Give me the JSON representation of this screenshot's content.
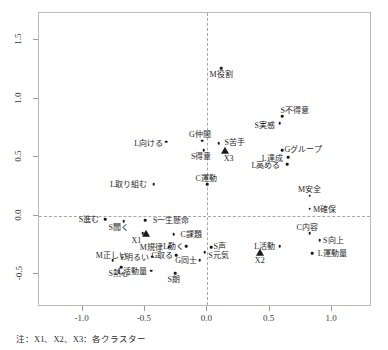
{
  "figure": {
    "footnote": "注：X1、X2、X3：各クラスター"
  },
  "chart_data": {
    "type": "scatter",
    "title": "",
    "xlabel": "",
    "ylabel": "",
    "xlim": [
      -1.35,
      1.32
    ],
    "ylim": [
      -0.78,
      1.73
    ],
    "grid": false,
    "legend": "none",
    "xticks": [
      "-1.0",
      "-0.5",
      "0.0",
      "0.5",
      "1.0"
    ],
    "xtick_values": [
      -1.0,
      -0.5,
      0.0,
      0.5,
      1.0
    ],
    "yticks": [
      "1.5",
      "1.0",
      "0.5",
      "0.0",
      "-0.5"
    ],
    "ytick_values": [
      1.5,
      1.0,
      0.5,
      0.0,
      -0.5
    ],
    "reference_lines": {
      "x": 0.0,
      "y": 0.0,
      "style": "dashed"
    },
    "annotations": [
      "X1、X2、X3 は各クラスターの重心（三角マーカー）"
    ],
    "points": [
      {
        "label": "M役割",
        "x": 0.11,
        "y": 1.26,
        "label_dx": 0,
        "label_dy": -0.055
      },
      {
        "label": "S不得意",
        "x": 0.6,
        "y": 0.85,
        "label_dx": 0.1,
        "label_dy": 0.05
      },
      {
        "label": "S実感",
        "x": 0.58,
        "y": 0.79,
        "label_dx": -0.12,
        "label_dy": -0.02
      },
      {
        "label": "G仲間",
        "x": -0.04,
        "y": 0.64,
        "label_dx": -0.02,
        "label_dy": 0.055
      },
      {
        "label": "S苦手",
        "x": 0.09,
        "y": 0.62,
        "label_dx": 0.13,
        "label_dy": 0.01
      },
      {
        "label": "S得意",
        "x": -0.03,
        "y": 0.56,
        "label_dx": -0.02,
        "label_dy": -0.055
      },
      {
        "label": "L向ける",
        "x": -0.33,
        "y": 0.63,
        "label_dx": -0.14,
        "label_dy": -0.01
      },
      {
        "label": "Gグループ",
        "x": 0.6,
        "y": 0.56,
        "label_dx": 0.17,
        "label_dy": 0.012
      },
      {
        "label": "L達成",
        "x": 0.65,
        "y": 0.5,
        "label_dx": -0.13,
        "label_dy": -0.005
      },
      {
        "label": "L高める",
        "x": 0.64,
        "y": 0.44,
        "label_dx": -0.17,
        "label_dy": -0.008
      },
      {
        "label": "C運動",
        "x": 0.0,
        "y": 0.27,
        "label_dx": -0.01,
        "label_dy": 0.055
      },
      {
        "label": "L取り組む",
        "x": -0.43,
        "y": 0.27,
        "label_dx": -0.2,
        "label_dy": 0.0
      },
      {
        "label": "M安全",
        "x": 0.82,
        "y": 0.17,
        "label_dx": 0.0,
        "label_dy": 0.055
      },
      {
        "label": "M確保",
        "x": 0.82,
        "y": 0.06,
        "label_dx": 0.12,
        "label_dy": 0.0
      },
      {
        "label": "S進む",
        "x": -0.82,
        "y": -0.03,
        "label_dx": -0.13,
        "label_dy": 0.0
      },
      {
        "label": "S聞く",
        "x": -0.67,
        "y": -0.05,
        "label_dx": -0.04,
        "label_dy": -0.05
      },
      {
        "label": "S一生懸命",
        "x": -0.5,
        "y": -0.04,
        "label_dx": 0.21,
        "label_dy": 0.0
      },
      {
        "label": "C内容",
        "x": 0.82,
        "y": -0.15,
        "label_dx": -0.02,
        "label_dy": 0.055
      },
      {
        "label": "S向上",
        "x": 0.9,
        "y": -0.21,
        "label_dx": 0.11,
        "label_dy": 0.0
      },
      {
        "label": "X1-point",
        "x": -0.52,
        "y": -0.15,
        "label_dx": 0.0,
        "label_dy": 0.0,
        "hidden_label": true
      },
      {
        "label": "C課題",
        "x": -0.27,
        "y": -0.16,
        "label_dx": 0.14,
        "label_dy": 0.0
      },
      {
        "label": "M規律",
        "x": -0.31,
        "y": -0.27,
        "label_dx": -0.14,
        "label_dy": 0.0
      },
      {
        "label": "L動く",
        "x": -0.17,
        "y": -0.26,
        "label_dx": -0.1,
        "label_dy": 0.0
      },
      {
        "label": "S声",
        "x": 0.03,
        "y": -0.27,
        "label_dx": 0.07,
        "label_dy": 0.015
      },
      {
        "label": "L活動",
        "x": 0.58,
        "y": -0.26,
        "label_dx": -0.12,
        "label_dy": 0.0
      },
      {
        "label": "S元気",
        "x": -0.02,
        "y": -0.31,
        "label_dx": 0.11,
        "label_dy": -0.025
      },
      {
        "label": "G取る",
        "x": -0.25,
        "y": -0.34,
        "label_dx": -0.11,
        "label_dy": 0.0
      },
      {
        "label": "E明るい",
        "x": -0.44,
        "y": -0.35,
        "label_dx": -0.14,
        "label_dy": 0.0
      },
      {
        "label": "G同士",
        "x": -0.06,
        "y": -0.38,
        "label_dx": -0.11,
        "label_dy": 0.0
      },
      {
        "label": "L運動量",
        "x": 0.84,
        "y": -0.32,
        "label_dx": 0.16,
        "label_dy": 0.0
      },
      {
        "label": "M正しい",
        "x": -0.76,
        "y": -0.38,
        "label_dx": -0.01,
        "label_dy": 0.048
      },
      {
        "label": "S熱心",
        "x": -0.69,
        "y": -0.44,
        "label_dx": -0.02,
        "label_dy": -0.05
      },
      {
        "label": "L活動量",
        "x": -0.45,
        "y": -0.47,
        "label_dx": -0.15,
        "label_dy": 0.0
      },
      {
        "label": "S朗",
        "x": -0.26,
        "y": -0.49,
        "label_dx": -0.01,
        "label_dy": -0.05
      }
    ],
    "centroids": [
      {
        "label": "X1",
        "x": -0.49,
        "y": -0.16,
        "label_dx": -0.08,
        "label_dy": -0.045
      },
      {
        "label": "X2",
        "x": 0.42,
        "y": -0.32,
        "label_dx": 0.0,
        "label_dy": -0.055
      },
      {
        "label": "X3",
        "x": 0.14,
        "y": 0.55,
        "label_dx": 0.03,
        "label_dy": -0.055
      }
    ]
  }
}
